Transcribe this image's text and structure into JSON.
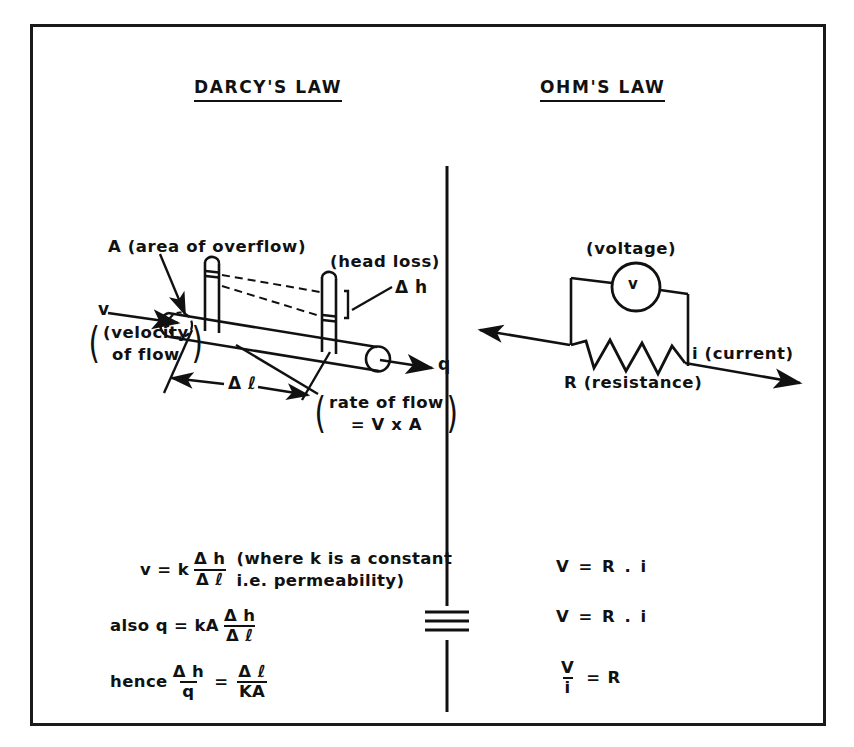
{
  "figure": {
    "border_color": "#1a1a1a",
    "ink_color": "#111111",
    "background": "#ffffff",
    "equivalence_symbol": "≡"
  },
  "left_panel": {
    "title": "DARCY'S LAW",
    "diagram": {
      "label_area": "A (area of overflow)",
      "label_head_loss": "(head loss)",
      "label_delta_h": "Δ h",
      "label_v": "v",
      "label_velocity_line1": "(velocity",
      "label_velocity_line2": "of flow",
      "label_delta_l": "Δ ℓ",
      "label_q": "q",
      "label_rate_line1": "rate of flow",
      "label_rate_line2": "= V x A"
    },
    "equations": [
      {
        "prefix": "v = k",
        "num": "Δ h",
        "den": "Δ ℓ",
        "note_line1": "(where k is a constant",
        "note_line2": "i.e. permeability)"
      },
      {
        "prefix": "also q = kA",
        "num": "Δ h",
        "den": "Δ ℓ",
        "note_line1": "",
        "note_line2": ""
      },
      {
        "prefix": "hence",
        "num": "Δ h",
        "den": "q",
        "operator": "=",
        "num2": "Δ ℓ",
        "den2": "KA"
      }
    ]
  },
  "right_panel": {
    "title": "OHM'S LAW",
    "circuit": {
      "label_voltage": "(voltage)",
      "meter_symbol": "v",
      "label_current": "i (current)",
      "label_resistance": "R (resistance)"
    },
    "equations": [
      {
        "text": "V = R . i"
      },
      {
        "text": "V = R . i"
      },
      {
        "num": "V",
        "den": "i",
        "operator": "=",
        "rhs": "R"
      }
    ]
  }
}
